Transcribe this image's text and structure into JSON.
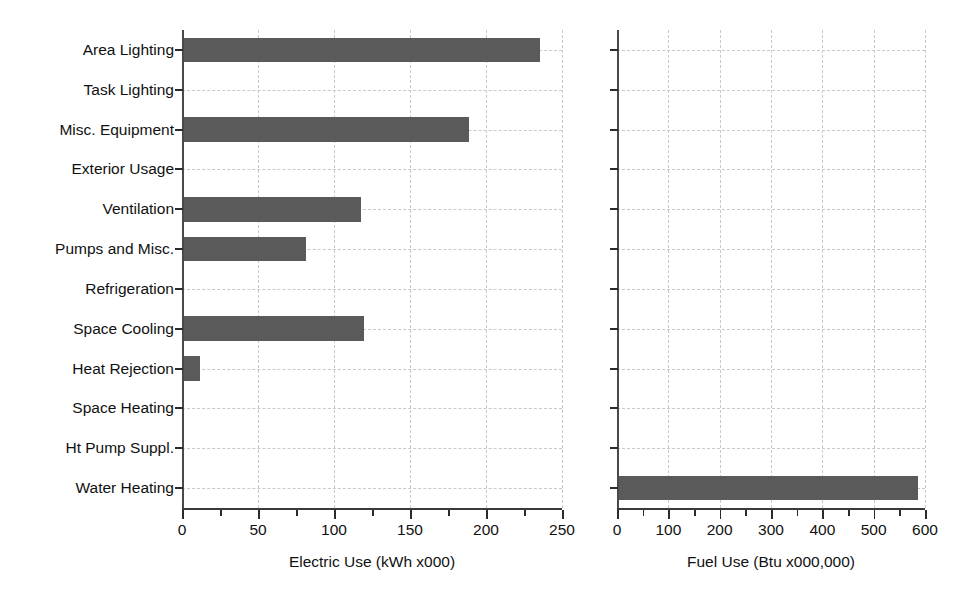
{
  "chart_data": [
    {
      "type": "bar",
      "orientation": "horizontal",
      "title": "",
      "xlabel": "Electric Use (kWh x000)",
      "ylabel": "",
      "categories": [
        "Area Lighting",
        "Task Lighting",
        "Misc. Equipment",
        "Exterior Usage",
        "Ventilation",
        "Pumps and Misc.",
        "Refrigeration",
        "Space Cooling",
        "Heat Rejection",
        "Space Heating",
        "Ht Pump Suppl.",
        "Water Heating"
      ],
      "values": [
        235,
        0,
        188,
        0,
        117,
        81,
        0,
        119,
        11,
        0,
        0,
        0
      ],
      "xlim": [
        0,
        250
      ],
      "xticks": [
        0,
        50,
        100,
        150,
        200,
        250
      ],
      "xticklabels": [
        "0",
        "50",
        "100",
        "150",
        "200",
        "250"
      ],
      "xminorticks": [
        25,
        75,
        125,
        175,
        225
      ],
      "grid": true,
      "bar_color": "#5a5a5a",
      "grid_color": "#c9c9c9",
      "legend": false
    },
    {
      "type": "bar",
      "orientation": "horizontal",
      "title": "",
      "xlabel": "Fuel Use (Btu x000,000)",
      "ylabel": "",
      "categories": [
        "Area Lighting",
        "Task Lighting",
        "Misc. Equipment",
        "Exterior Usage",
        "Ventilation",
        "Pumps and Misc.",
        "Refrigeration",
        "Space Cooling",
        "Heat Rejection",
        "Space Heating",
        "Ht Pump Suppl.",
        "Water Heating"
      ],
      "values": [
        0,
        0,
        0,
        0,
        0,
        0,
        0,
        0,
        0,
        0,
        0,
        584
      ],
      "xlim": [
        0,
        600
      ],
      "xticks": [
        0,
        100,
        200,
        300,
        400,
        500,
        600
      ],
      "xticklabels": [
        "0",
        "100",
        "200",
        "300",
        "400",
        "500",
        "600"
      ],
      "xminorticks": [
        50,
        150,
        250,
        350,
        450,
        550
      ],
      "grid": true,
      "bar_color": "#5a5a5a",
      "grid_color": "#c9c9c9",
      "legend": false
    }
  ],
  "categories": [
    "Area Lighting",
    "Task Lighting",
    "Misc. Equipment",
    "Exterior Usage",
    "Ventilation",
    "Pumps and Misc.",
    "Refrigeration",
    "Space Cooling",
    "Heat Rejection",
    "Space Heating",
    "Ht Pump Suppl.",
    "Water Heating"
  ],
  "left_chart": {
    "axis_title": "Electric Use (kWh x000)",
    "tick_labels": [
      "0",
      "50",
      "100",
      "150",
      "200",
      "250"
    ]
  },
  "right_chart": {
    "axis_title": "Fuel Use (Btu x000,000)",
    "tick_labels": [
      "0",
      "100",
      "200",
      "300",
      "400",
      "500",
      "600"
    ]
  }
}
